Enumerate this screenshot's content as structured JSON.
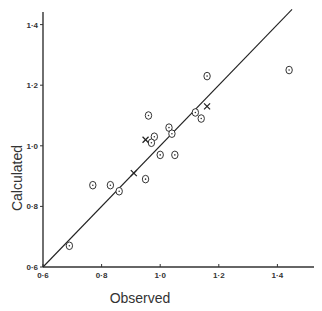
{
  "chart_data": {
    "type": "scatter",
    "title": "",
    "xlabel": "Observed",
    "ylabel": "Calculated",
    "xlim": [
      0.6,
      1.45
    ],
    "ylim": [
      0.6,
      1.45
    ],
    "x_ticks": [
      "0·6",
      "0·8",
      "1·0",
      "1·2",
      "1·4"
    ],
    "y_ticks": [
      "0·6",
      "0·8",
      "1·0",
      "1·2",
      "1·4"
    ],
    "x_tick_values": [
      0.6,
      0.8,
      1.0,
      1.2,
      1.4
    ],
    "y_tick_values": [
      0.6,
      0.8,
      1.0,
      1.2,
      1.4
    ],
    "grid": false,
    "legend": null,
    "reference_line": {
      "type": "identity",
      "from": [
        0.6,
        0.6
      ],
      "to": [
        1.45,
        1.45
      ]
    },
    "series": [
      {
        "name": "circle-dot markers",
        "marker": "circle-dot",
        "points": [
          [
            0.69,
            0.67
          ],
          [
            0.77,
            0.87
          ],
          [
            0.83,
            0.87
          ],
          [
            0.86,
            0.85
          ],
          [
            0.95,
            0.89
          ],
          [
            0.96,
            1.1
          ],
          [
            0.98,
            1.03
          ],
          [
            0.97,
            1.01
          ],
          [
            1.0,
            0.97
          ],
          [
            1.05,
            0.97
          ],
          [
            1.03,
            1.06
          ],
          [
            1.04,
            1.04
          ],
          [
            1.12,
            1.11
          ],
          [
            1.14,
            1.09
          ],
          [
            1.16,
            1.23
          ],
          [
            1.44,
            1.25
          ]
        ]
      },
      {
        "name": "cross markers",
        "marker": "x",
        "points": [
          [
            0.91,
            0.91
          ],
          [
            0.95,
            1.02
          ],
          [
            1.16,
            1.13
          ]
        ]
      }
    ]
  }
}
